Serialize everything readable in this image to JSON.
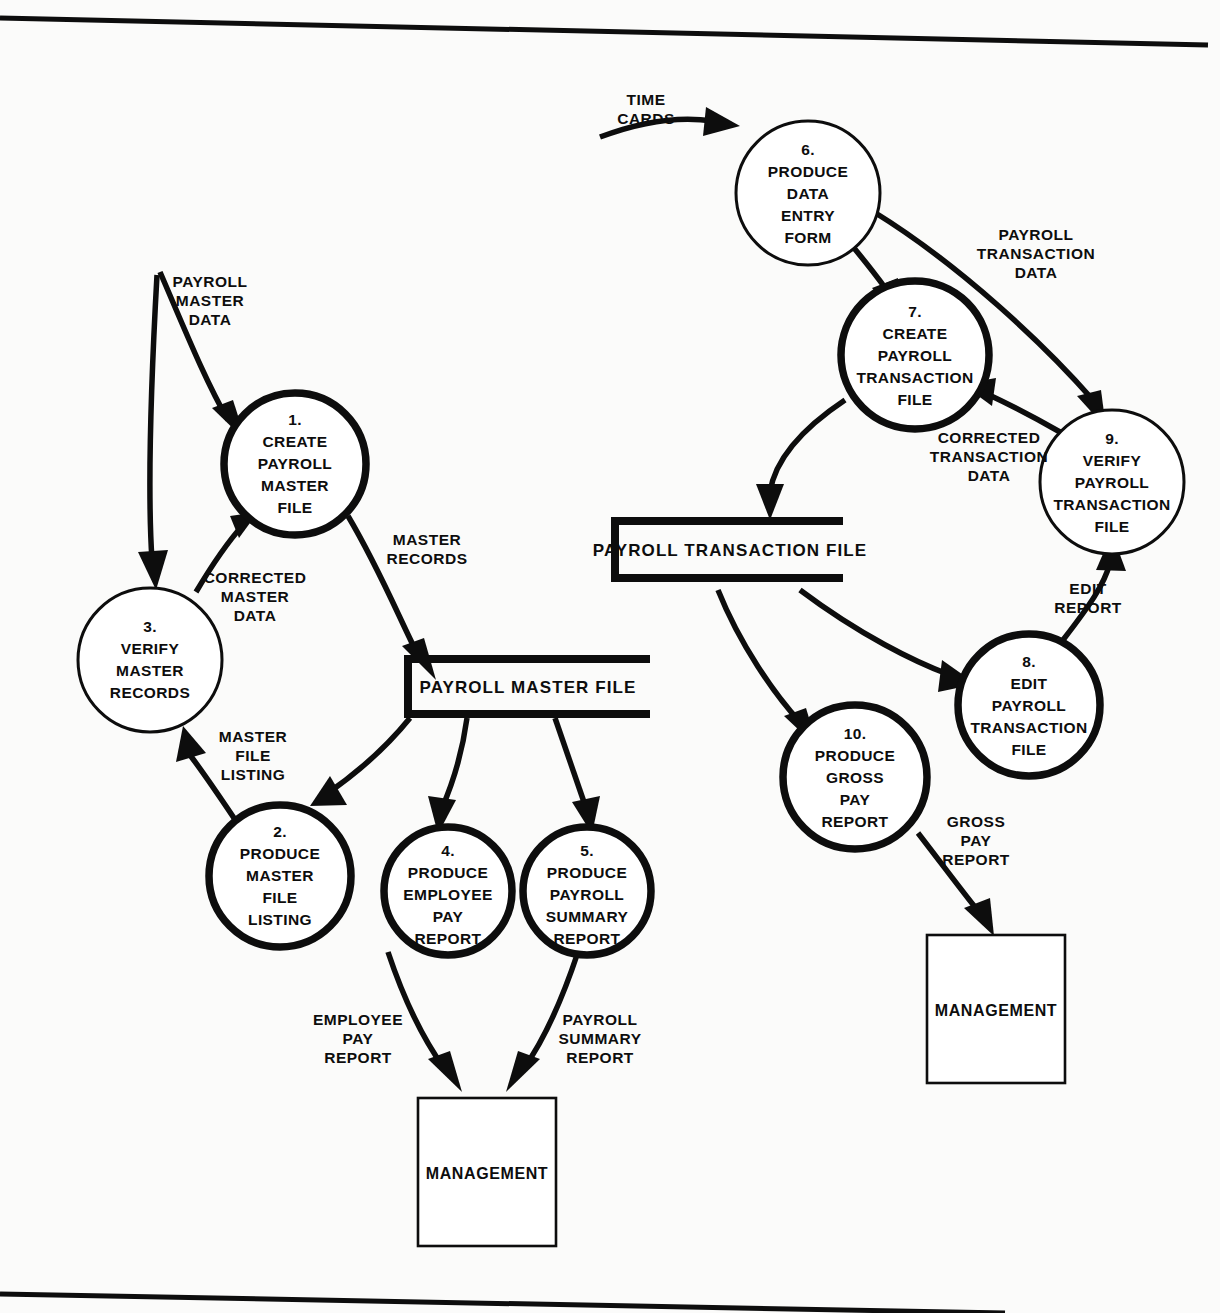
{
  "diagram": {
    "type": "data-flow-diagram"
  },
  "processes": [
    {
      "id": "p1",
      "number": "1.",
      "lines": [
        "CREATE",
        "PAYROLL",
        "MASTER",
        "FILE"
      ],
      "weight": "thick"
    },
    {
      "id": "p2",
      "number": "2.",
      "lines": [
        "PRODUCE",
        "MASTER",
        "FILE",
        "LISTING"
      ],
      "weight": "thick"
    },
    {
      "id": "p3",
      "number": "3.",
      "lines": [
        "VERIFY",
        "MASTER",
        "RECORDS"
      ],
      "weight": "thin"
    },
    {
      "id": "p4",
      "number": "4.",
      "lines": [
        "PRODUCE",
        "EMPLOYEE",
        "PAY",
        "REPORT"
      ],
      "weight": "thick"
    },
    {
      "id": "p5",
      "number": "5.",
      "lines": [
        "PRODUCE",
        "PAYROLL",
        "SUMMARY",
        "REPORT"
      ],
      "weight": "thick"
    },
    {
      "id": "p6",
      "number": "6.",
      "lines": [
        "PRODUCE",
        "DATA",
        "ENTRY",
        "FORM"
      ],
      "weight": "thin"
    },
    {
      "id": "p7",
      "number": "7.",
      "lines": [
        "CREATE",
        "PAYROLL",
        "TRANSACTION",
        "FILE"
      ],
      "weight": "thick"
    },
    {
      "id": "p8",
      "number": "8.",
      "lines": [
        "EDIT",
        "PAYROLL",
        "TRANSACTION",
        "FILE"
      ],
      "weight": "thick"
    },
    {
      "id": "p9",
      "number": "9.",
      "lines": [
        "VERIFY",
        "PAYROLL",
        "TRANSACTION",
        "FILE"
      ],
      "weight": "thin"
    },
    {
      "id": "p10",
      "number": "10.",
      "lines": [
        "PRODUCE",
        "GROSS",
        "PAY",
        "REPORT"
      ],
      "weight": "thick"
    }
  ],
  "data_stores": [
    {
      "id": "ds-master",
      "label": "PAYROLL MASTER FILE"
    },
    {
      "id": "ds-transaction",
      "label": "PAYROLL TRANSACTION FILE"
    }
  ],
  "external_entities": [
    {
      "id": "ext-management-left",
      "label": "MANAGEMENT"
    },
    {
      "id": "ext-management-right",
      "label": "MANAGEMENT"
    }
  ],
  "flows": [
    {
      "id": "f-time-cards",
      "lines": [
        "TIME",
        "CARDS"
      ]
    },
    {
      "id": "f-payroll-master-data",
      "lines": [
        "PAYROLL",
        "MASTER",
        "DATA"
      ]
    },
    {
      "id": "f-corrected-master-data",
      "lines": [
        "CORRECTED",
        "MASTER",
        "DATA"
      ]
    },
    {
      "id": "f-master-records",
      "lines": [
        "MASTER",
        "RECORDS"
      ]
    },
    {
      "id": "f-master-file-listing",
      "lines": [
        "MASTER",
        "FILE",
        "LISTING"
      ]
    },
    {
      "id": "f-employee-pay-report",
      "lines": [
        "EMPLOYEE",
        "PAY",
        "REPORT"
      ]
    },
    {
      "id": "f-payroll-summary-report",
      "lines": [
        "PAYROLL",
        "SUMMARY",
        "REPORT"
      ]
    },
    {
      "id": "f-payroll-transaction-data",
      "lines": [
        "PAYROLL",
        "TRANSACTION",
        "DATA"
      ]
    },
    {
      "id": "f-corrected-transaction-data",
      "lines": [
        "CORRECTED",
        "TRANSACTION",
        "DATA"
      ]
    },
    {
      "id": "f-edit-report",
      "lines": [
        "EDIT",
        "REPORT"
      ]
    },
    {
      "id": "f-gross-pay-report",
      "lines": [
        "GROSS",
        "PAY",
        "REPORT"
      ]
    }
  ],
  "colors": {
    "ink": "#0d0d0d",
    "paper": "#fbfbfa"
  }
}
